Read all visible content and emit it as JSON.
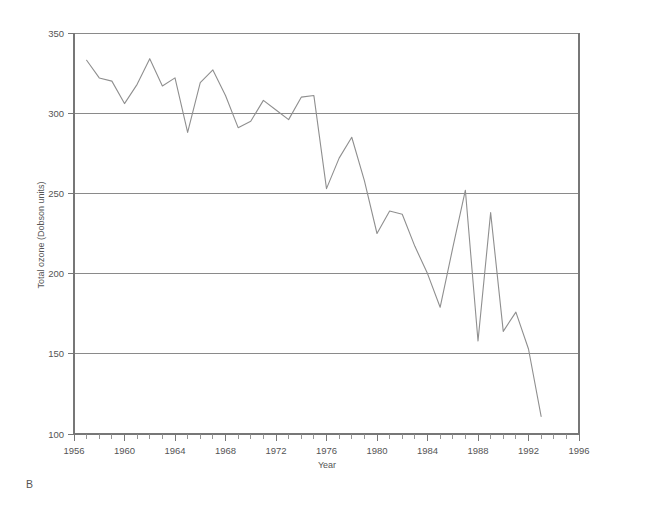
{
  "panel": {
    "label": "B"
  },
  "chart_data": {
    "type": "line",
    "title": "",
    "xlabel": "Year",
    "ylabel": "Total ozone (Dobson units)",
    "xlim": [
      1956,
      1996
    ],
    "ylim": [
      100,
      350
    ],
    "xtick_step": 4,
    "xminor_tick_step": 1,
    "ytick_step": 50,
    "grid": "horizontal",
    "legend": "none",
    "xticks": [
      1956,
      1960,
      1964,
      1968,
      1972,
      1976,
      1980,
      1984,
      1988,
      1992,
      1996
    ],
    "xtick_labels": [
      "1956",
      "1960",
      "1964",
      "1968",
      "1972",
      "1976",
      "1980",
      "1984",
      "1988",
      "1992",
      "1996"
    ],
    "yticks": [
      100,
      150,
      200,
      250,
      300,
      350
    ],
    "ytick_labels": [
      "100",
      "150",
      "200",
      "250",
      "300",
      "350"
    ],
    "series": [
      {
        "name": "Total ozone",
        "color": "#8f8f8f",
        "x": [
          1957,
          1958,
          1959,
          1960,
          1961,
          1962,
          1963,
          1964,
          1965,
          1966,
          1967,
          1968,
          1969,
          1970,
          1971,
          1972,
          1973,
          1974,
          1975,
          1976,
          1977,
          1978,
          1979,
          1980,
          1981,
          1982,
          1983,
          1984,
          1985,
          1986,
          1987,
          1988,
          1989,
          1990,
          1991,
          1992,
          1993
        ],
        "values": [
          333,
          322,
          320,
          306,
          318,
          334,
          317,
          322,
          288,
          319,
          327,
          311,
          291,
          295,
          308,
          302,
          296,
          310,
          311,
          253,
          272,
          285,
          258,
          225,
          239,
          237,
          217,
          200,
          179,
          216,
          252,
          158,
          238,
          164,
          176,
          153,
          111
        ]
      }
    ]
  }
}
